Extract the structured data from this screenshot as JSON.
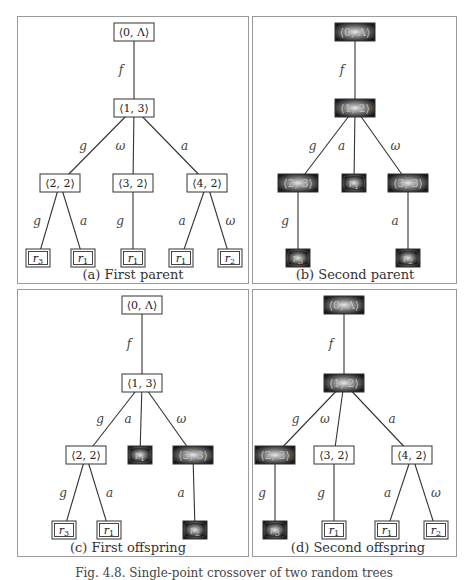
{
  "figure_caption": "Fig. 4.8. Single-point crossover of two random trees",
  "colors": {
    "line": "#333333",
    "panel_border": "#9a9a9a",
    "highlight_dark": "#1a1a1a",
    "highlight_light": "#d8d8d8"
  },
  "panels": [
    {
      "id": "a",
      "caption": "(a) First parent",
      "box": [
        17,
        16,
        232,
        268
      ],
      "caption_pos": [
        133,
        276
      ],
      "nodes": [
        {
          "id": "n0",
          "label": "⟨0, Λ⟩",
          "x": 134,
          "y": 32,
          "type": "inner",
          "hl": false
        },
        {
          "id": "n1",
          "label": "⟨1, 3⟩",
          "x": 134,
          "y": 108,
          "type": "inner",
          "hl": false
        },
        {
          "id": "n2",
          "label": "⟨2, 2⟩",
          "x": 60,
          "y": 183,
          "type": "inner",
          "hl": false
        },
        {
          "id": "n3",
          "label": "⟨3, 2⟩",
          "x": 133,
          "y": 183,
          "type": "inner",
          "hl": false
        },
        {
          "id": "n4",
          "label": "⟨4, 2⟩",
          "x": 207,
          "y": 183,
          "type": "inner",
          "hl": false
        },
        {
          "id": "l1",
          "label": "r3",
          "x": 38,
          "y": 258,
          "type": "leaf",
          "hl": false
        },
        {
          "id": "l2",
          "label": "r1",
          "x": 83,
          "y": 258,
          "type": "leaf",
          "hl": false
        },
        {
          "id": "l3",
          "label": "r1",
          "x": 133,
          "y": 258,
          "type": "leaf",
          "hl": false
        },
        {
          "id": "l4",
          "label": "r1",
          "x": 181,
          "y": 258,
          "type": "leaf",
          "hl": false
        },
        {
          "id": "l5",
          "label": "r2",
          "x": 230,
          "y": 258,
          "type": "leaf",
          "hl": false
        }
      ],
      "edges": [
        {
          "from": "n0",
          "to": "n1",
          "label": "f"
        },
        {
          "from": "n1",
          "to": "n2",
          "label": "g"
        },
        {
          "from": "n1",
          "to": "n3",
          "label": "ω"
        },
        {
          "from": "n1",
          "to": "n4",
          "label": "a"
        },
        {
          "from": "n2",
          "to": "l1",
          "label": "g"
        },
        {
          "from": "n2",
          "to": "l2",
          "label": "a"
        },
        {
          "from": "n3",
          "to": "l3",
          "label": "g"
        },
        {
          "from": "n4",
          "to": "l4",
          "label": "a"
        },
        {
          "from": "n4",
          "to": "l5",
          "label": "ω"
        }
      ]
    },
    {
      "id": "b",
      "caption": "(b) Second parent",
      "box": [
        252,
        16,
        205,
        268
      ],
      "caption_pos": [
        355,
        276
      ],
      "nodes": [
        {
          "id": "n0",
          "label": "⟨0, Λ⟩",
          "x": 355,
          "y": 32,
          "type": "inner",
          "hl": true
        },
        {
          "id": "n1",
          "label": "⟨1, 2⟩",
          "x": 355,
          "y": 108,
          "type": "inner",
          "hl": true
        },
        {
          "id": "n2",
          "label": "⟨2, 3⟩",
          "x": 298,
          "y": 183,
          "type": "inner",
          "hl": true
        },
        {
          "id": "n3",
          "label": "r1",
          "x": 354,
          "y": 183,
          "type": "leaf",
          "hl": true
        },
        {
          "id": "n4",
          "label": "⟨3, 3⟩",
          "x": 408,
          "y": 183,
          "type": "inner",
          "hl": true
        },
        {
          "id": "l1",
          "label": "r3",
          "x": 298,
          "y": 258,
          "type": "leaf",
          "hl": true
        },
        {
          "id": "l2",
          "label": "r2",
          "x": 408,
          "y": 258,
          "type": "leaf",
          "hl": true
        }
      ],
      "edges": [
        {
          "from": "n0",
          "to": "n1",
          "label": "f"
        },
        {
          "from": "n1",
          "to": "n2",
          "label": "g"
        },
        {
          "from": "n1",
          "to": "n3",
          "label": "a"
        },
        {
          "from": "n1",
          "to": "n4",
          "label": "ω"
        },
        {
          "from": "n2",
          "to": "l1",
          "label": "g"
        },
        {
          "from": "n4",
          "to": "l2",
          "label": "a"
        }
      ]
    },
    {
      "id": "c",
      "caption": "(c) First offspring",
      "box": [
        17,
        289,
        232,
        268
      ],
      "caption_pos": [
        128,
        549
      ],
      "nodes": [
        {
          "id": "n0",
          "label": "⟨0, Λ⟩",
          "x": 142,
          "y": 305,
          "type": "inner",
          "hl": false
        },
        {
          "id": "n1",
          "label": "⟨1, 3⟩",
          "x": 142,
          "y": 383,
          "type": "inner",
          "hl": false
        },
        {
          "id": "n2",
          "label": "⟨2, 2⟩",
          "x": 86,
          "y": 455,
          "type": "inner",
          "hl": false
        },
        {
          "id": "n3",
          "label": "r1",
          "x": 140,
          "y": 455,
          "type": "leaf",
          "hl": true
        },
        {
          "id": "n4",
          "label": "⟨3, 3⟩",
          "x": 193,
          "y": 455,
          "type": "inner",
          "hl": true
        },
        {
          "id": "l1",
          "label": "r3",
          "x": 64,
          "y": 530,
          "type": "leaf",
          "hl": false
        },
        {
          "id": "l2",
          "label": "r1",
          "x": 109,
          "y": 530,
          "type": "leaf",
          "hl": false
        },
        {
          "id": "l3",
          "label": "r2",
          "x": 195,
          "y": 530,
          "type": "leaf",
          "hl": true
        }
      ],
      "edges": [
        {
          "from": "n0",
          "to": "n1",
          "label": "f"
        },
        {
          "from": "n1",
          "to": "n2",
          "label": "g"
        },
        {
          "from": "n1",
          "to": "n3",
          "label": "a"
        },
        {
          "from": "n1",
          "to": "n4",
          "label": "ω"
        },
        {
          "from": "n2",
          "to": "l1",
          "label": "g"
        },
        {
          "from": "n2",
          "to": "l2",
          "label": "a"
        },
        {
          "from": "n4",
          "to": "l3",
          "label": "a"
        }
      ]
    },
    {
      "id": "d",
      "caption": "(d) Second offspring",
      "box": [
        252,
        289,
        205,
        268
      ],
      "caption_pos": [
        358,
        549
      ],
      "nodes": [
        {
          "id": "n0",
          "label": "⟨0, Λ⟩",
          "x": 344,
          "y": 305,
          "type": "inner",
          "hl": true
        },
        {
          "id": "n1",
          "label": "⟨1, 2⟩",
          "x": 344,
          "y": 383,
          "type": "inner",
          "hl": true
        },
        {
          "id": "n2",
          "label": "⟨2, 3⟩",
          "x": 275,
          "y": 455,
          "type": "inner",
          "hl": true
        },
        {
          "id": "n3",
          "label": "⟨3, 2⟩",
          "x": 334,
          "y": 455,
          "type": "inner",
          "hl": false
        },
        {
          "id": "n4",
          "label": "⟨4, 2⟩",
          "x": 412,
          "y": 455,
          "type": "inner",
          "hl": false
        },
        {
          "id": "l1",
          "label": "r3",
          "x": 275,
          "y": 530,
          "type": "leaf",
          "hl": true
        },
        {
          "id": "l2",
          "label": "r1",
          "x": 334,
          "y": 530,
          "type": "leaf",
          "hl": false
        },
        {
          "id": "l3",
          "label": "r1",
          "x": 387,
          "y": 530,
          "type": "leaf",
          "hl": false
        },
        {
          "id": "l4",
          "label": "r2",
          "x": 436,
          "y": 530,
          "type": "leaf",
          "hl": false
        }
      ],
      "edges": [
        {
          "from": "n0",
          "to": "n1",
          "label": "f"
        },
        {
          "from": "n1",
          "to": "n2",
          "label": "g"
        },
        {
          "from": "n1",
          "to": "n3",
          "label": "ω"
        },
        {
          "from": "n1",
          "to": "n4",
          "label": "a"
        },
        {
          "from": "n2",
          "to": "l1",
          "label": "g"
        },
        {
          "from": "n3",
          "to": "l2",
          "label": "g"
        },
        {
          "from": "n4",
          "to": "l3",
          "label": "a"
        },
        {
          "from": "n4",
          "to": "l4",
          "label": "ω"
        }
      ]
    }
  ]
}
